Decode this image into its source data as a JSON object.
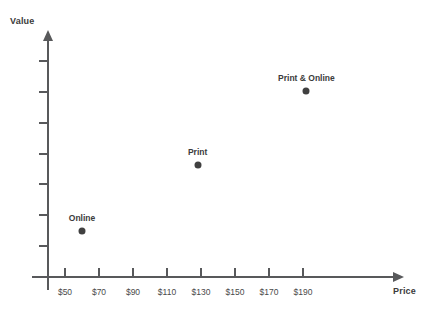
{
  "chart_data": {
    "type": "scatter",
    "title": "",
    "xlabel": "Price",
    "ylabel": "Value",
    "xlim": [
      40,
      200
    ],
    "ylim": [
      0,
      7
    ],
    "grid": false,
    "legend": "none",
    "x_tick_labels": [
      "$50",
      "$70",
      "$90",
      "$110",
      "$130",
      "$150",
      "$170",
      "$190"
    ],
    "x_tick_values": [
      50,
      70,
      90,
      110,
      130,
      150,
      170,
      190
    ],
    "y_tick_labels": [
      "",
      "",
      "",
      "",
      "",
      "",
      ""
    ],
    "y_tick_count": 7,
    "points": [
      {
        "label": "Online",
        "x": 60,
        "y": 1.45,
        "price_label": "$60"
      },
      {
        "label": "Print",
        "x": 128,
        "y": 3.6,
        "price_label": "$128"
      },
      {
        "label": "Print & Online",
        "x": 192,
        "y": 6.0,
        "price_label": "$192"
      }
    ]
  },
  "axes": {
    "y_title": "Value",
    "x_title": "Price"
  }
}
